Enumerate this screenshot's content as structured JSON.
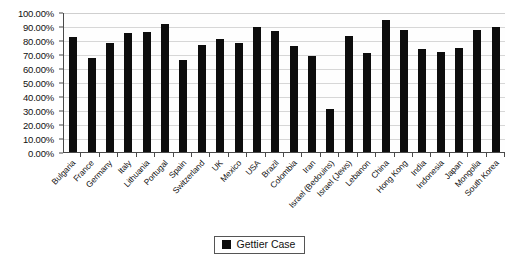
{
  "chart_data": {
    "type": "bar",
    "title": "",
    "subtitle": "",
    "xlabel": "",
    "ylabel": "",
    "ylim": [
      0,
      100
    ],
    "ytick_step": 10,
    "grid": true,
    "legend_position": "bottom",
    "bar_color": "#0d0d0d",
    "categories": [
      "Bulgaria",
      "France",
      "Germany",
      "Italy",
      "Lithuania",
      "Portugal",
      "Spain",
      "Switzerland",
      "UK",
      "Mexico",
      "USA",
      "Brazil",
      "Colombia",
      "Iran",
      "Israel (Bedouins)",
      "Israel (Jews)",
      "Lebanon",
      "China",
      "Hong Kong",
      "India",
      "Indonesia",
      "Japan",
      "Mongolia",
      "South Korea"
    ],
    "series": [
      {
        "name": "Gettier Case",
        "values": [
          82.0,
          67.5,
          78.0,
          85.0,
          86.0,
          91.5,
          66.0,
          76.5,
          81.0,
          78.0,
          89.5,
          86.5,
          76.0,
          68.5,
          31.0,
          83.0,
          71.0,
          94.5,
          87.0,
          73.5,
          71.5,
          74.0,
          87.0,
          89.0
        ]
      }
    ],
    "ytick_labels": [
      "100.00%",
      "90.00%",
      "80.00%",
      "70.00%",
      "60.00%",
      "50.00%",
      "40.00%",
      "30.00%",
      "20.00%",
      "10.00%",
      "0.00%"
    ],
    "ytick_values": [
      100,
      90,
      80,
      70,
      60,
      50,
      40,
      30,
      20,
      10,
      0
    ]
  },
  "legend": {
    "entries": [
      {
        "label": "Gettier Case",
        "color": "#0d0d0d"
      }
    ]
  }
}
